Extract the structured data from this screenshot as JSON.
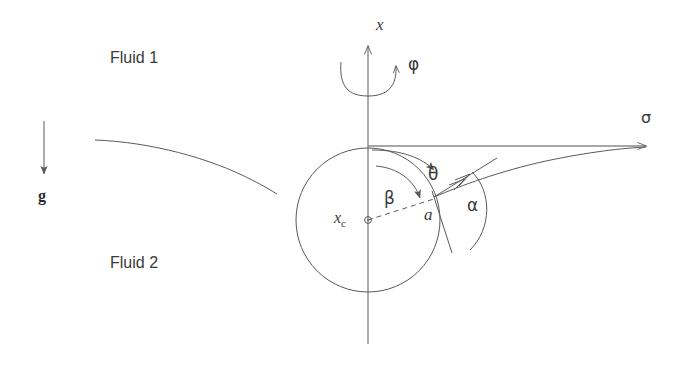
{
  "figure": {
    "background_color": "#ffffff",
    "line_color": "#5a5a5a",
    "text_color": "#3a3a3a"
  },
  "labels": {
    "fluid_upper": "Fluid 1",
    "fluid_lower": "Fluid 2",
    "gravity": "g",
    "axis_vertical": "x",
    "azimuthal_angle": "φ",
    "polar_angle": "θ",
    "beta_angle": "β",
    "contact_angle": "α",
    "radius": "a",
    "center_symbol": "x",
    "center_subscript": "c",
    "surface_tension": "σ"
  },
  "geometry": {
    "circle_center_x": 368,
    "circle_center_y": 220,
    "circle_radius": 72,
    "vertical_axis_x": 368,
    "vertical_axis_top_y": 43,
    "vertical_axis_bottom_y": 344,
    "horizontal_axis_y": 146,
    "horizontal_axis_end_x": 650,
    "contact_point_x": 434,
    "contact_point_y": 197,
    "gravity_arrow_x": 44,
    "gravity_arrow_top_y": 121,
    "gravity_arrow_bottom_y": 177,
    "interface_left_start_x": 95,
    "interface_left_start_y": 140,
    "interface_right_end_x": 646,
    "interface_right_end_y": 148
  }
}
